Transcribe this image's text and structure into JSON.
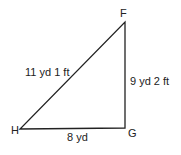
{
  "diagram": {
    "type": "right-triangle",
    "vertices": [
      {
        "name": "F",
        "x": 125,
        "y": 22
      },
      {
        "name": "G",
        "x": 125,
        "y": 128
      },
      {
        "name": "H",
        "x": 20,
        "y": 129
      }
    ],
    "sides": {
      "HF": "11 yd 1 ft",
      "FG": "9 yd 2 ft",
      "HG": "8 yd"
    },
    "line_color": "#222222"
  }
}
